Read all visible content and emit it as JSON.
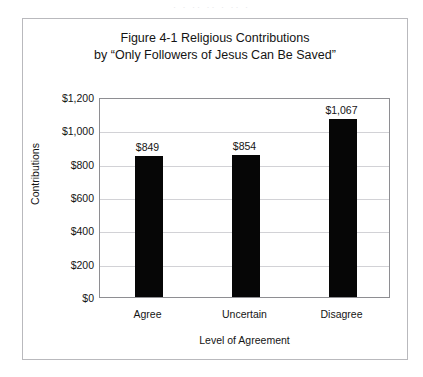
{
  "scan": {
    "artifact_text": "· · ·· ·· · ·· ·"
  },
  "figure": {
    "title_line1": "Figure 4-1 Religious Contributions",
    "title_line2": "by “Only Followers of Jesus Can Be Saved”"
  },
  "chart_data": {
    "type": "bar",
    "title": "Figure 4-1 Religious Contributions by “Only Followers of Jesus Can Be Saved”",
    "xlabel": "Level of Agreement",
    "ylabel": "Contributions",
    "categories": [
      "Agree",
      "Uncertain",
      "Disagree"
    ],
    "values": [
      849,
      854,
      1067
    ],
    "value_labels": [
      "$849",
      "$854",
      "$1,067"
    ],
    "ylim": [
      0,
      1200
    ],
    "ytick_values": [
      0,
      200,
      400,
      600,
      800,
      1000,
      1200
    ],
    "ytick_labels": [
      "$0",
      "$200",
      "$400",
      "$600",
      "$800",
      "$1,000",
      "$1,200"
    ],
    "grid": true,
    "grid_axis": "y",
    "legend": false,
    "bar_color": "#060606",
    "plot_border_color": "#8e8e92",
    "gridline_color": "#d2d2d6",
    "frame_color": "#b9b9bd",
    "background": "#ffffff"
  }
}
